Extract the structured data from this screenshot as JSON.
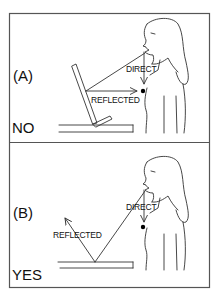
{
  "colors": {
    "line": "#333333",
    "frame": "#555555",
    "dot": "#000000",
    "background": "#ffffff"
  },
  "panels": [
    {
      "id_label": "(A)",
      "verdict": "NO",
      "direct_label": "DIRECT",
      "reflected_label": "REFLECTED",
      "description": "Mic receives direct sound and reflection from tilted board"
    },
    {
      "id_label": "(B)",
      "verdict": "YES",
      "direct_label": "DIRECT",
      "reflected_label": "REFLECTED",
      "description": "Reflection from flat surface is directed away from mic"
    }
  ]
}
